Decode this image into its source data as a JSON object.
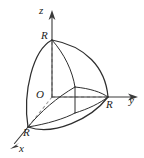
{
  "figure": {
    "kind": "3d-coordinate-solid-diagram",
    "background_color": "#ffffff",
    "line_color": "#2e2e2e",
    "dashed_line_color": "#9a9a9a",
    "label_color": "#1c1c1c",
    "axes": [
      {
        "name": "z-axis",
        "label": "z",
        "direction": "up",
        "label_x": 39,
        "label_y": 5
      },
      {
        "name": "y-axis",
        "label": "y",
        "direction": "right",
        "label_x": 129,
        "label_y": 95
      },
      {
        "name": "x-axis",
        "label": "x",
        "direction": "down-left",
        "label_x": 19,
        "label_y": 143
      }
    ],
    "origin": {
      "label": "O",
      "x": 36,
      "y": 89
    },
    "radius_marks": [
      {
        "name": "radius-on-z",
        "label": "R",
        "axis": "z",
        "label_x": 41,
        "label_y": 30
      },
      {
        "name": "radius-on-y",
        "label": "R",
        "axis": "y",
        "label_x": 106,
        "label_y": 99
      },
      {
        "name": "radius-on-x",
        "label": "R",
        "axis": "x",
        "label_x": 23,
        "label_y": 127
      }
    ],
    "geometry": {
      "z_axis": {
        "x1": 52,
        "y1": 97,
        "x2": 52,
        "y2": 14
      },
      "z_arrow": "52,11 49,20 52,17.5 55,20",
      "y_axis": {
        "x1": 52,
        "y1": 97,
        "x2": 134,
        "y2": 97
      },
      "y_arrow": "137,97 128,94 130.5,97 128,100",
      "x_axis_solid": {
        "x1": 28,
        "y1": 127,
        "x2": 13,
        "y2": 145
      },
      "x_arrow": "10,148 18,142.5 15.5,145.5 18.5,145.5",
      "x_axis_dashed": {
        "x1": 52,
        "y1": 97,
        "x2": 28,
        "y2": 127
      },
      "z_dashed": {
        "x1": 52,
        "y1": 97,
        "x2": 52,
        "y2": 40
      },
      "y_dashed": {
        "x1": 52,
        "y1": 97,
        "x2": 108,
        "y2": 97
      },
      "apex_z": {
        "x": 52,
        "y": 40
      },
      "point_y_R": {
        "x": 108,
        "y": 97
      },
      "point_x_R": {
        "x": 28,
        "y": 127
      },
      "inner_top": {
        "x": 75,
        "y": 87
      },
      "inner_bottom": {
        "x": 75,
        "y": 113
      },
      "sphere_outline_left": "M 52 40 C 32 50, 22 92, 28 127",
      "sphere_outline_right": "M 52 40 C 84 46, 105 68, 108 97",
      "sphere_bottom_arc": "M 28 127 C 52 135, 90 118, 108 97",
      "inner_rib_from_apex": "M 52 40 C 64 54, 72 72, 75 87",
      "inner_arc_to_yR": "M 75 87 C 90 88, 101 92, 108 97",
      "inner_arc_to_xR": "M 75 87 C 57 97, 40 112, 28 127",
      "lower_inner_arc": "M 52 122 C 65 117, 73 113, 75 113",
      "lower_inner_arc2": "M 75 113 C 88 109, 99 103, 108 97",
      "inner_vertical": {
        "x1": 75,
        "y1": 87,
        "x2": 75,
        "y2": 113
      },
      "base_chord": {
        "x1": 28,
        "y1": 127,
        "x2": 75,
        "y2": 113
      }
    }
  }
}
